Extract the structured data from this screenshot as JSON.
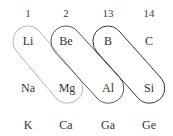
{
  "diagram": {
    "groups": [
      {
        "label": "1",
        "x": 28
      },
      {
        "label": "2",
        "x": 66
      },
      {
        "label": "13",
        "x": 108
      },
      {
        "label": "14",
        "x": 149
      }
    ],
    "rows": [
      {
        "y": 41,
        "elements": [
          "Li",
          "Be",
          "B",
          "C"
        ]
      },
      {
        "y": 88,
        "elements": [
          "Na",
          "Mg",
          "Al",
          "Si"
        ]
      },
      {
        "y": 125,
        "elements": [
          "K",
          "Ca",
          "Ga",
          "Ge"
        ]
      }
    ],
    "group_label_y": 13,
    "diagonal_pairs": [
      {
        "from": "Li",
        "to": "Mg",
        "color": "#b8b8b8"
      },
      {
        "from": "Be",
        "to": "Al",
        "color": "#555555"
      },
      {
        "from": "B",
        "to": "Si",
        "color": "#333333"
      }
    ]
  }
}
